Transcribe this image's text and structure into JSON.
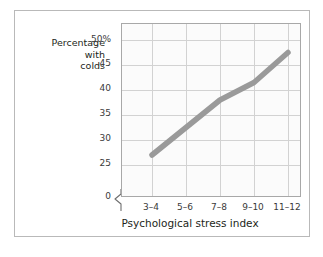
{
  "chart_data": {
    "type": "line",
    "title": "",
    "xlabel": "Psychological stress index",
    "ylabel": "Percentage with colds",
    "ylabel_lines": [
      "Percentage",
      "with",
      "colds"
    ],
    "categories": [
      "3–4",
      "5–6",
      "7–8",
      "9–10",
      "11–12"
    ],
    "values": [
      27,
      32.5,
      38,
      41.5,
      47.5
    ],
    "series": [
      {
        "name": "Percentage with colds",
        "values": [
          27,
          32.5,
          38,
          41.5,
          47.5
        ],
        "color": "#9a9a9a"
      }
    ],
    "y_tick_labels": [
      "50%",
      "45",
      "40",
      "35",
      "30",
      "25",
      "0"
    ],
    "y_tick_values": [
      50,
      45,
      40,
      35,
      30,
      25,
      0
    ],
    "ylim": [
      25,
      52
    ],
    "y_axis_break": true,
    "y_axis_break_between": [
      0,
      25
    ],
    "grid": true,
    "legend": "none",
    "colors": {
      "line": "#9a9a9a",
      "gridline": "#d2d2d2",
      "plot_border": "#a8a8a8",
      "figure_border": "#b9b9b9",
      "plot_background": "#fbfbfb",
      "text": "#231f20",
      "tick_text": "#3a3a3a"
    }
  }
}
